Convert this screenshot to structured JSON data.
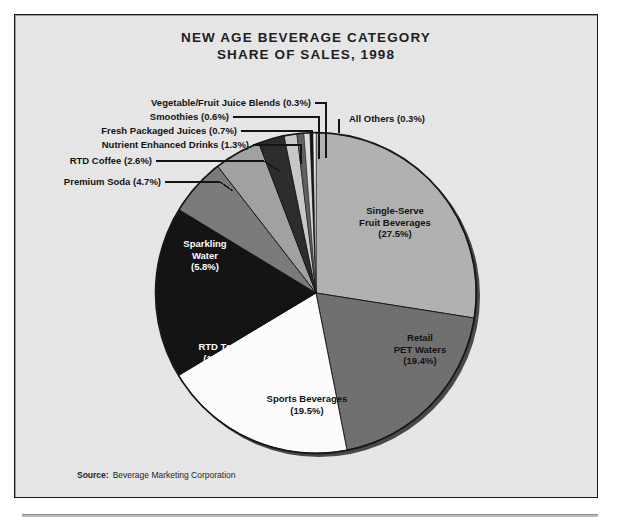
{
  "chart": {
    "title_line1": "NEW AGE BEVERAGE CATEGORY",
    "title_line2": "SHARE OF SALES, 1998",
    "source_label": "Source:",
    "source_value": "Beverage Marketing Corporation"
  },
  "chart_data": {
    "type": "pie",
    "title": "NEW AGE BEVERAGE CATEGORY SHARE OF SALES, 1998",
    "unit": "percent of sales",
    "start_angle_deg": 0,
    "direction": "clockwise",
    "legend": "none (direct labels with leader lines)",
    "categories": [
      "Single-Serve Fruit Beverages",
      "Retail PET Waters",
      "Sports Beverages",
      "RTD Teas",
      "Sparkling Water",
      "Premium Soda",
      "RTD Coffee",
      "Nutrient Enhanced Drinks",
      "Fresh Packaged Juices",
      "Smoothies",
      "Vegetable/Fruit Juice Blends",
      "All Others"
    ],
    "values": [
      27.5,
      19.4,
      19.5,
      17.3,
      5.8,
      4.7,
      2.6,
      1.3,
      0.7,
      0.6,
      0.3,
      0.3
    ],
    "colors": [
      "#b2b2b2",
      "#6f6f6f",
      "#ffffff",
      "#111111",
      "#7a7a7a",
      "#a2a2a2",
      "#2b2b2b",
      "#c9c9c9",
      "#5f5f5f",
      "#dcdcdc",
      "#161616",
      "#f2f2f2"
    ],
    "slices": [
      {
        "label": "Single-Serve Fruit Beverages",
        "value": 27.5,
        "display": "(27.5%)",
        "color": "#b2b2b2",
        "label_placement": "inside",
        "text_color": "#101010"
      },
      {
        "label": "Retail PET Waters",
        "value": 19.4,
        "display": "(19.4%)",
        "color": "#6f6f6f",
        "label_placement": "inside",
        "text_color": "#101010"
      },
      {
        "label": "Sports Beverages",
        "value": 19.5,
        "display": "(19.5%)",
        "color": "#ffffff",
        "label_placement": "inside",
        "text_color": "#101010"
      },
      {
        "label": "RTD Teas",
        "value": 17.3,
        "display": "(17.3%)",
        "color": "#111111",
        "label_placement": "inside",
        "text_color": "#ffffff"
      },
      {
        "label": "Sparkling Water",
        "value": 5.8,
        "display": "(5.8%)",
        "color": "#7a7a7a",
        "label_placement": "inside",
        "text_color": "#ffffff"
      },
      {
        "label": "Premium Soda",
        "value": 4.7,
        "display": "(4.7%)",
        "color": "#a2a2a2",
        "label_placement": "leader-left",
        "text_color": "#101010"
      },
      {
        "label": "RTD Coffee",
        "value": 2.6,
        "display": "(2.6%)",
        "color": "#2b2b2b",
        "label_placement": "leader-left",
        "text_color": "#101010"
      },
      {
        "label": "Nutrient Enhanced Drinks",
        "value": 1.3,
        "display": "(1.3%)",
        "color": "#c9c9c9",
        "label_placement": "leader-left",
        "text_color": "#101010"
      },
      {
        "label": "Fresh Packaged Juices",
        "value": 0.7,
        "display": "(0.7%)",
        "color": "#5f5f5f",
        "label_placement": "leader-left",
        "text_color": "#101010"
      },
      {
        "label": "Smoothies",
        "value": 0.6,
        "display": "(0.6%)",
        "color": "#dcdcdc",
        "label_placement": "leader-left",
        "text_color": "#101010"
      },
      {
        "label": "Vegetable/Fruit Juice Blends",
        "value": 0.3,
        "display": "(0.3%)",
        "color": "#161616",
        "label_placement": "leader-left",
        "text_color": "#101010"
      },
      {
        "label": "All Others",
        "value": 0.3,
        "display": "(0.3%)",
        "color": "#f2f2f2",
        "label_placement": "leader-right",
        "text_color": "#101010"
      }
    ]
  },
  "labels": {
    "single_serve_l1": "Single-Serve",
    "single_serve_l2": "Fruit Beverages",
    "single_serve_l3": "(27.5%)",
    "retail_pet_l1": "Retail",
    "retail_pet_l2": "PET Waters",
    "retail_pet_l3": "(19.4%)",
    "sports_l1": "Sports Beverages",
    "sports_l2": "(19.5%)",
    "rtd_teas_l1": "RTD Teas",
    "rtd_teas_l2": "(17.3%)",
    "sparkling_l1": "Sparkling",
    "sparkling_l2": "Water",
    "sparkling_l3": "(5.8%)",
    "veg_fruit": "Vegetable/Fruit Juice Blends (0.3%)",
    "smoothies": "Smoothies (0.6%)",
    "fresh_juices": "Fresh Packaged Juices (0.7%)",
    "nutrient": "Nutrient Enhanced Drinks (1.3%)",
    "rtd_coffee": "RTD Coffee (2.6%)",
    "premium_soda": "Premium Soda (4.7%)",
    "all_others": "All Others (0.3%)"
  },
  "colors": {
    "frame_bg": "#e8e8e8",
    "frame_border": "#1a1a1a",
    "text": "#101010",
    "pie_outline": "#141414"
  }
}
